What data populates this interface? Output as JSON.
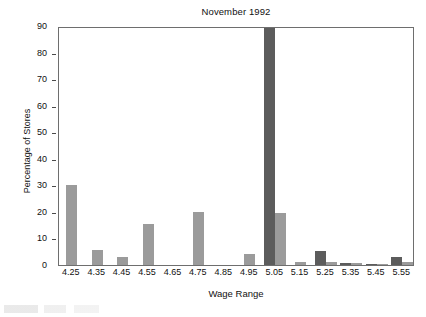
{
  "chart_data": {
    "type": "bar",
    "title": "November 1992",
    "xlabel": "Wage Range",
    "ylabel": "Percentage of Stores",
    "categories": [
      "4.25",
      "4.35",
      "4.45",
      "4.55",
      "4.65",
      "4.75",
      "4.85",
      "4.95",
      "5.05",
      "5.15",
      "5.25",
      "5.35",
      "5.45",
      "5.55"
    ],
    "ylim": [
      0,
      90
    ],
    "yticks": [
      0,
      10,
      20,
      30,
      40,
      50,
      60,
      70,
      80,
      90
    ],
    "grid": false,
    "legend": "none",
    "clipped_note": "dark bar at 5.05 is clipped at the top of the axis (value exceeds 90)",
    "series": [
      {
        "name": "dark",
        "color": "#5c5c5c",
        "values": [
          0,
          0,
          0,
          0,
          0,
          0,
          0,
          0,
          90,
          0,
          5.3,
          0.6,
          0.5,
          3.0
        ]
      },
      {
        "name": "light",
        "color": "#9b9b9b",
        "values": [
          30.2,
          5.6,
          3.0,
          15.5,
          0,
          19.8,
          0,
          4.1,
          19.6,
          1.1,
          1.2,
          0.6,
          0.4,
          1.0
        ]
      }
    ]
  },
  "axis": {
    "y_tick_labels": [
      "0",
      "10",
      "20",
      "30",
      "40",
      "50",
      "60",
      "70",
      "80",
      "90"
    ],
    "x_tick_labels": [
      "4.25",
      "4.35",
      "4.45",
      "4.55",
      "4.65",
      "4.75",
      "4.85",
      "4.95",
      "5.05",
      "5.15",
      "5.25",
      "5.35",
      "5.45",
      "5.55"
    ]
  }
}
